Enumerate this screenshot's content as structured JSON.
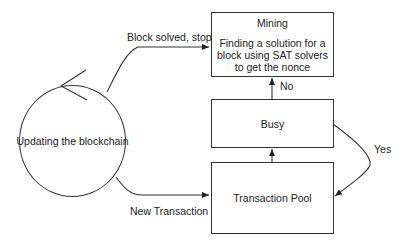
{
  "diagram": {
    "type": "flowchart",
    "nodes": {
      "updating": {
        "label": "Updating the blockchain",
        "shape": "circle"
      },
      "mining": {
        "title": "Mining",
        "description": "Finding a solution for a block using SAT solvers to get the nonce",
        "shape": "rectangle"
      },
      "busy": {
        "label": "Busy",
        "shape": "rectangle"
      },
      "pool": {
        "label": "Transaction Pool",
        "shape": "rectangle"
      }
    },
    "edges": [
      {
        "from": "updating",
        "to": "mining",
        "label": "Block solved, stop"
      },
      {
        "from": "updating",
        "to": "pool",
        "label": "New Transaction"
      },
      {
        "from": "pool",
        "to": "busy",
        "label": ""
      },
      {
        "from": "busy",
        "to": "mining",
        "label": "No"
      },
      {
        "from": "busy",
        "to": "pool",
        "label": "Yes"
      }
    ],
    "edge_labels": {
      "block_solved": "Block solved, stop",
      "new_transaction": "New Transaction",
      "no": "No",
      "yes": "Yes"
    },
    "colors": {
      "stroke": "#333333",
      "text": "#222222",
      "background": "#ffffff"
    }
  }
}
